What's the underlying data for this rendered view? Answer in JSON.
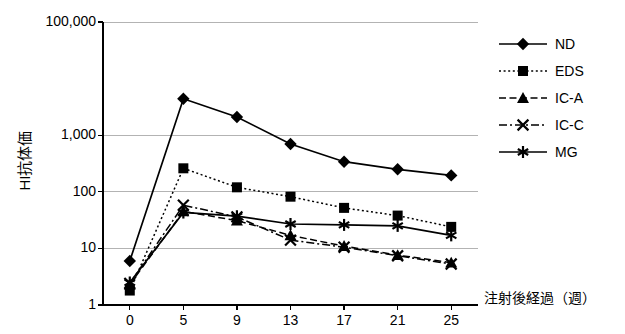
{
  "chart_data": {
    "type": "line",
    "title": "",
    "xlabel": "注射後経過（週）",
    "ylabel": "HI抗体価",
    "yscale": "log",
    "ylim": [
      1,
      100000
    ],
    "grid": true,
    "legend_position": "right",
    "categories": [
      "0",
      "5",
      "9",
      "13",
      "17",
      "21",
      "25"
    ],
    "ytick_labels": [
      "100,000",
      "1,000",
      "100",
      "10",
      "1"
    ],
    "ytick_values": [
      100000,
      1000,
      100,
      10,
      1
    ],
    "series": [
      {
        "name": "ND",
        "marker": "diamond",
        "line": "solid",
        "color": "#000000",
        "values": [
          6,
          4400,
          2100,
          700,
          340,
          250,
          195
        ]
      },
      {
        "name": "EDS",
        "marker": "square",
        "line": "dotted",
        "color": "#000000",
        "values": [
          1.8,
          260,
          120,
          82,
          52,
          38,
          24
        ]
      },
      {
        "name": "IC-A",
        "marker": "triangle",
        "line": "dashed",
        "color": "#000000",
        "values": [
          2.3,
          45,
          31,
          17,
          11,
          7.6,
          5.6
        ]
      },
      {
        "name": "IC-C",
        "marker": "x",
        "line": "dashdot",
        "color": "#000000",
        "values": [
          2.4,
          58,
          36,
          14,
          10.5,
          7.4,
          5.3
        ]
      },
      {
        "name": "MG",
        "marker": "asterisk",
        "line": "solid",
        "color": "#000000",
        "values": [
          2.5,
          43,
          37,
          27,
          26,
          25,
          17
        ]
      }
    ]
  },
  "legend": {
    "items": [
      {
        "label": "ND"
      },
      {
        "label": "EDS"
      },
      {
        "label": "IC-A"
      },
      {
        "label": "IC-C"
      },
      {
        "label": "MG"
      }
    ]
  },
  "colors": {
    "axis": "#000000",
    "grid": "#b3b3b3",
    "plot_background": "#ffffff"
  }
}
